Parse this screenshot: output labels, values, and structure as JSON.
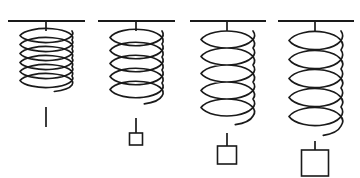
{
  "figure": {
    "background_color": "#ffffff",
    "stroke_color": "#1a1a1a",
    "weight_fill_color": "#ffffff",
    "canvas_width": 360,
    "canvas_height": 178
  },
  "chart_data": {
    "type": "diagram",
    "xlabel": "",
    "ylabel": "",
    "categories": [
      "spring-1",
      "spring-2",
      "spring-3",
      "spring-4"
    ],
    "series": [
      {
        "name": "coil_count",
        "values": [
          6,
          5,
          5,
          5
        ]
      },
      {
        "name": "coil_pitch_px",
        "values": [
          9,
          13,
          17,
          19
        ]
      },
      {
        "name": "spring_length_px",
        "values": [
          73,
          84,
          99,
          107
        ]
      },
      {
        "name": "weight_size_px",
        "values": [
          0,
          12,
          18,
          26
        ]
      }
    ]
  },
  "springs": [
    {
      "id": "spring-1",
      "label": "Spring 1 - no load, compressed",
      "ceiling": {
        "x1": 8,
        "x2": 85,
        "y": 21,
        "thickness": 2.2
      },
      "anchor_x": 46,
      "top_stem": {
        "y1": 21,
        "y2": 31
      },
      "coil": {
        "top_y": 31,
        "rx": 26,
        "ry": 9,
        "pitch": 9,
        "turns": 6,
        "stroke_width": 1.7
      },
      "bottom_stem": {
        "y1": 107,
        "y2": 127
      },
      "weight": null
    },
    {
      "id": "spring-2",
      "label": "Spring 2 - light load",
      "ceiling": {
        "x1": 98,
        "x2": 175,
        "y": 21,
        "thickness": 2.2
      },
      "anchor_x": 136,
      "top_stem": {
        "y1": 21,
        "y2": 31
      },
      "coil": {
        "top_y": 31,
        "rx": 26,
        "ry": 11,
        "pitch": 13,
        "turns": 5,
        "stroke_width": 1.7
      },
      "bottom_stem": {
        "y1": 118,
        "y2": 133
      },
      "weight": {
        "width": 13,
        "height": 12,
        "stroke_width": 1.6
      }
    },
    {
      "id": "spring-3",
      "label": "Spring 3 - medium load",
      "ceiling": {
        "x1": 190,
        "x2": 266,
        "y": 21,
        "thickness": 2.2
      },
      "anchor_x": 227,
      "top_stem": {
        "y1": 21,
        "y2": 31
      },
      "coil": {
        "top_y": 31,
        "rx": 26,
        "ry": 12,
        "pitch": 17,
        "turns": 5,
        "stroke_width": 1.7
      },
      "bottom_stem": {
        "y1": 133,
        "y2": 146
      },
      "weight": {
        "width": 19,
        "height": 18,
        "stroke_width": 1.6
      }
    },
    {
      "id": "spring-4",
      "label": "Spring 4 - heavy load",
      "ceiling": {
        "x1": 278,
        "x2": 354,
        "y": 21,
        "thickness": 2.2
      },
      "anchor_x": 315,
      "top_stem": {
        "y1": 21,
        "y2": 31
      },
      "coil": {
        "top_y": 31,
        "rx": 26,
        "ry": 13,
        "pitch": 19,
        "turns": 5,
        "stroke_width": 1.7
      },
      "bottom_stem": {
        "y1": 141,
        "y2": 150
      },
      "weight": {
        "width": 27,
        "height": 26,
        "stroke_width": 1.6
      }
    }
  ]
}
